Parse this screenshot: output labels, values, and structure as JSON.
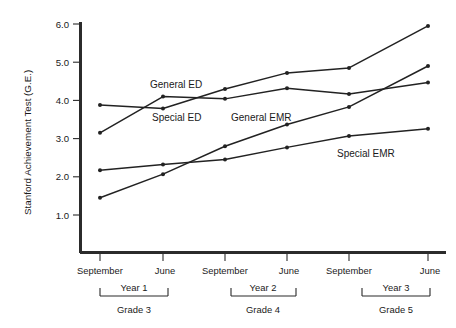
{
  "chart_data": {
    "type": "line",
    "title": "",
    "subtitle": "",
    "xlabel": "",
    "ylabel": "Stanford Achievement Test (G.E.)",
    "ylim": [
      0.0,
      6.0
    ],
    "yticks": [
      "1.0",
      "2.0",
      "3.0",
      "4.0",
      "5.0",
      "6.0"
    ],
    "ytick_values": [
      1.0,
      2.0,
      3.0,
      4.0,
      5.0,
      6.0
    ],
    "grid": false,
    "legend_position": "inline-annotations",
    "x": [
      "September",
      "June",
      "September",
      "June",
      "September",
      "June"
    ],
    "categories": [
      "September",
      "June",
      "September",
      "June",
      "September",
      "June"
    ],
    "x_groups": [
      {
        "year_label": "Year 1",
        "grade_label": "Grade 3",
        "ticks": [
          "September",
          "June"
        ]
      },
      {
        "year_label": "Year 2",
        "grade_label": "Grade 4",
        "ticks": [
          "September",
          "June"
        ]
      },
      {
        "year_label": "Year 3",
        "grade_label": "Grade 5",
        "ticks": [
          "September",
          "June"
        ]
      }
    ],
    "series": [
      {
        "name": "General ED",
        "values": [
          3.88,
          3.79,
          4.3,
          4.72,
          4.85,
          5.95
        ],
        "color": "#222222"
      },
      {
        "name": "Special ED",
        "values": [
          3.15,
          4.1,
          4.04,
          4.32,
          4.17,
          4.47
        ],
        "color": "#222222"
      },
      {
        "name": "General EMR",
        "values": [
          1.45,
          2.07,
          2.8,
          3.37,
          3.83,
          4.9
        ],
        "color": "#222222"
      },
      {
        "name": "Special EMR",
        "values": [
          2.17,
          2.32,
          2.45,
          2.77,
          3.07,
          3.26
        ],
        "color": "#222222"
      }
    ],
    "annotations": [
      {
        "text": "General ED",
        "x_px": 150,
        "y_px": 88
      },
      {
        "text": "Special ED",
        "x_px": 152,
        "y_px": 121
      },
      {
        "text": "General EMR",
        "x_px": 231,
        "y_px": 121
      },
      {
        "text": "Special EMR",
        "x_px": 337,
        "y_px": 157
      }
    ]
  },
  "axis": {
    "y_title": "Stanford Achievement Test (G.E.)",
    "y_tick_labels": [
      "6.0",
      "5.0",
      "4.0",
      "3.0",
      "2.0",
      "1.0"
    ],
    "x_tick_labels": [
      "September",
      "June",
      "September",
      "June",
      "September",
      "June"
    ],
    "year_labels": [
      "Year 1",
      "Year 2",
      "Year 3"
    ],
    "grade_labels": [
      "Grade 3",
      "Grade 4",
      "Grade 5"
    ]
  },
  "colors": {
    "ink": "#222222",
    "axis": "#2b2b2b",
    "background": "#ffffff"
  }
}
